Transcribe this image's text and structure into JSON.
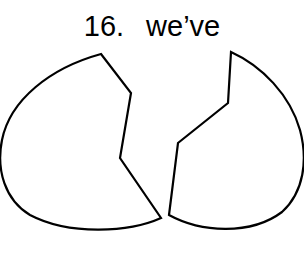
{
  "title": {
    "number": "16.",
    "word": "we’ve"
  },
  "shapes": [
    {
      "name": "left-fragment",
      "stroke": "#000000",
      "fill": "#ffffff"
    },
    {
      "name": "right-fragment",
      "stroke": "#000000",
      "fill": "#ffffff"
    }
  ]
}
